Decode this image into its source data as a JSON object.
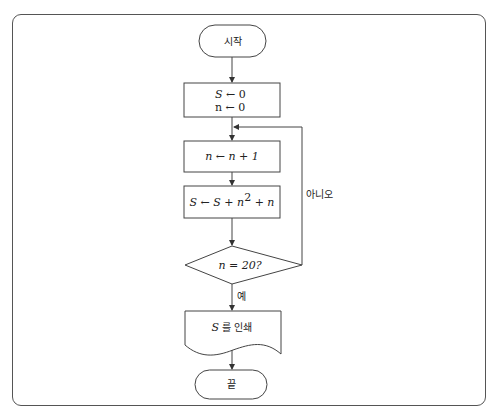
{
  "flowchart": {
    "start": {
      "label": "시작"
    },
    "init": {
      "line1_var": "S",
      "line1_op": " ← 0",
      "line2_var": "n",
      "line2_op": " ← 0"
    },
    "increment": {
      "text": "n ← n + 1"
    },
    "accumulate": {
      "text_prefix": "S ← S + n",
      "superscript": "2",
      "text_suffix": " + n"
    },
    "decision": {
      "text": "n = 20?"
    },
    "branch_no": {
      "label": "아니오"
    },
    "branch_yes": {
      "label": "예"
    },
    "output": {
      "var": "S",
      "label": " 를 인쇄"
    },
    "end": {
      "label": "끝"
    }
  }
}
